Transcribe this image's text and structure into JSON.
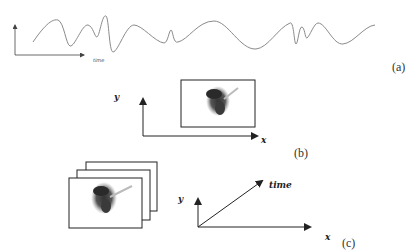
{
  "panels": {
    "a": {
      "caption": "(a)",
      "axis_label": "time",
      "description": "1D signal waveform over time",
      "wave_color": "#8a8a8a"
    },
    "b": {
      "caption": "(b)",
      "x_label": "x",
      "y_label": "y",
      "description": "Single 2D image frame on x-y plane"
    },
    "c": {
      "caption": "(c)",
      "x_label": "x",
      "y_label": "y",
      "time_label": "time",
      "description": "Stack of image frames over time (video)",
      "frame_count": 3
    }
  }
}
